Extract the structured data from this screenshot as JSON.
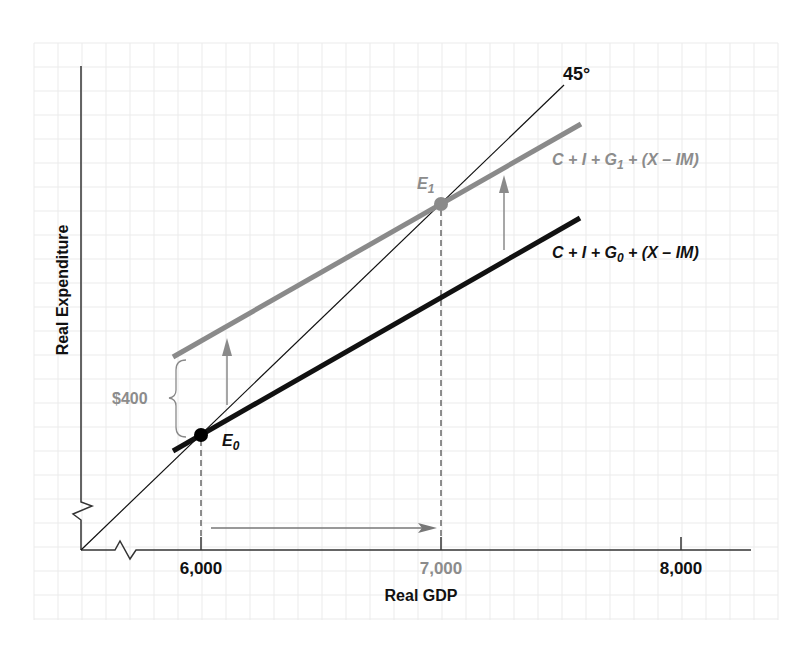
{
  "chart_data": {
    "type": "line",
    "title": "",
    "xlabel": "Real GDP",
    "ylabel": "Real Expenditure",
    "x_ticks": [
      "6,000",
      "7,000",
      "8,000"
    ],
    "x_tick_values": [
      6000,
      7000,
      8000
    ],
    "grid": true,
    "axis_breaks": [
      "x",
      "y"
    ],
    "series": [
      {
        "name": "45° line",
        "label": "45°",
        "style": "thin black",
        "points": [
          [
            5500,
            5500
          ],
          [
            7520,
            7520
          ]
        ]
      },
      {
        "name": "C + I + G0 + (X - IM)",
        "style": "thick black",
        "points": [
          [
            5880,
            5940
          ],
          [
            7580,
            6850
          ]
        ]
      },
      {
        "name": "C + I + G1 + (X - IM)",
        "style": "thick gray",
        "points": [
          [
            5880,
            6330
          ],
          [
            7580,
            7240
          ]
        ]
      }
    ],
    "points": [
      {
        "label": "E0",
        "x": 6000,
        "y": 6000,
        "color": "#000000"
      },
      {
        "label": "E1",
        "x": 7000,
        "y": 7000,
        "color": "#888888"
      }
    ],
    "annotations": [
      {
        "type": "brace",
        "label": "$400",
        "at_x": 6000,
        "from_y": 6000,
        "to_y": 6400
      },
      {
        "type": "arrow-up",
        "from": "C + I + G0 + (X - IM)",
        "to": "C + I + G1 + (X - IM)"
      },
      {
        "type": "arrow-right",
        "from_x": 6000,
        "to_x": 7000
      },
      {
        "type": "dashed-drop",
        "x": 6000
      },
      {
        "type": "dashed-drop",
        "x": 7000
      }
    ]
  },
  "labels": {
    "y_axis": "Real Expenditure",
    "x_axis": "Real GDP",
    "tick_6000": "6,000",
    "tick_7000": "7,000",
    "tick_8000": "8,000",
    "angle": "45°",
    "brace": "$400",
    "e0_main": "E",
    "e0_sub": "0",
    "e1_main": "E",
    "e1_sub": "1",
    "ae1": {
      "pre": "C + I + G",
      "sub": "1",
      "post": " + (X – IM)"
    },
    "ae0": {
      "pre": "C + I + G",
      "sub": "0",
      "post": " + (X – IM)"
    }
  },
  "colors": {
    "grid": "#ebebeb",
    "axis": "#333333",
    "black_line": "#111111",
    "gray_line": "#8a8a8a",
    "gray_text": "#8c8c8c"
  }
}
